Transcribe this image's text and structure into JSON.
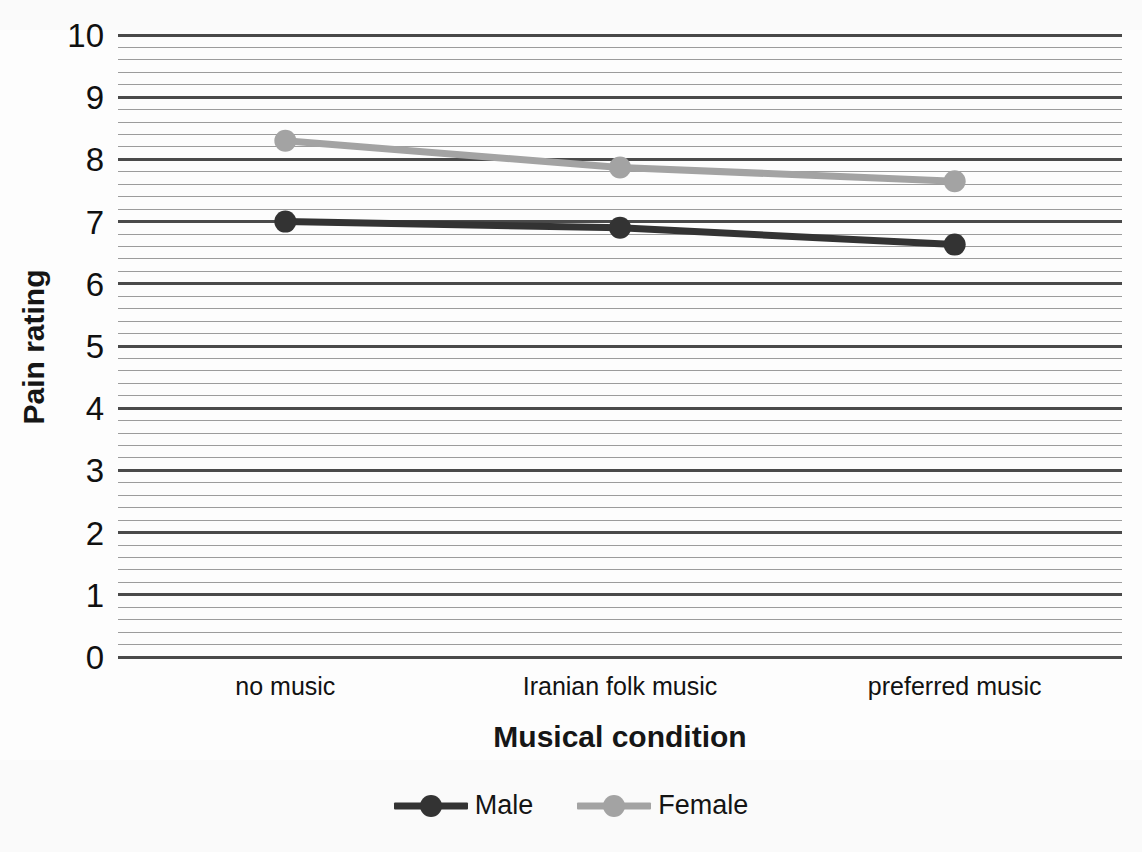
{
  "chart_data": {
    "type": "line",
    "title": "",
    "subtitle": "",
    "xlabel": "Musical condition",
    "ylabel": "Pain rating",
    "categories": [
      "no music",
      "Iranian folk music",
      "preferred music"
    ],
    "series": [
      {
        "name": "Male",
        "values": [
          7.0,
          6.9,
          6.63
        ],
        "color": "#333333"
      },
      {
        "name": "Female",
        "values": [
          8.3,
          7.87,
          7.65
        ],
        "color": "#a3a3a3"
      }
    ],
    "ylim": [
      0,
      10
    ],
    "y_ticks": [
      0,
      1,
      2,
      3,
      4,
      5,
      6,
      7,
      8,
      9,
      10
    ],
    "y_tick_labels": [
      "0",
      "1",
      "2",
      "3",
      "4",
      "5",
      "6",
      "7",
      "8",
      "9",
      "10"
    ],
    "y_minor_step": 0.2,
    "grid": true,
    "grid_axis": "y",
    "legend_position": "bottom",
    "marker": "circle",
    "marker_size": 22
  },
  "axes": {
    "y_title": "Pain rating",
    "x_title": "Musical condition"
  },
  "legend": {
    "entries": [
      {
        "label": "Male",
        "color": "#333333"
      },
      {
        "label": "Female",
        "color": "#a3a3a3"
      }
    ]
  },
  "colors": {
    "male": "#333333",
    "female": "#a3a3a3",
    "gridline_major": "#4a4a4a",
    "gridline_minor": "#9c9c9c",
    "text": "#121212",
    "background": "#fdfdfd"
  }
}
